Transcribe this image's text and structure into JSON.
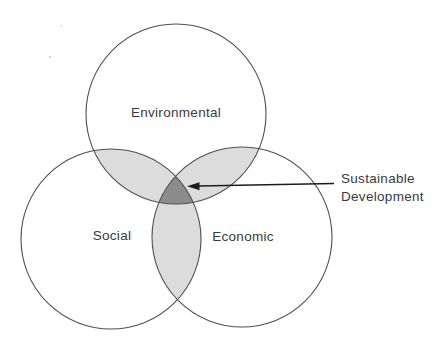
{
  "diagram": {
    "type": "venn-3-circle",
    "circles": [
      {
        "id": "environmental",
        "label": "Environmental"
      },
      {
        "id": "social",
        "label": "Social"
      },
      {
        "id": "economic",
        "label": "Economic"
      }
    ],
    "annotation": {
      "label": "Sustainable Development",
      "points_to": "center-intersection"
    },
    "colors": {
      "background": "#ffffff",
      "overlap_light": "#dcdcdc",
      "overlap_dark": "#8c8c8c",
      "stroke": "#4f4f4f",
      "arrow": "#1c1c1c",
      "text": "#3a3a3a"
    }
  }
}
